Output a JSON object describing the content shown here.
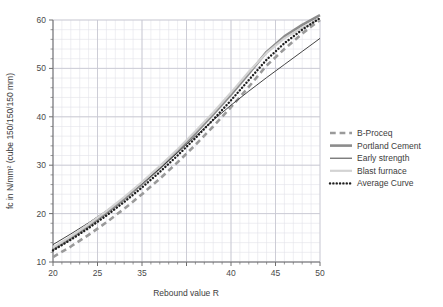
{
  "chart_data": {
    "type": "line",
    "title": "",
    "xlabel": "Rebound value R",
    "ylabel": "fc in N/mm² (cube 150/150/150 mm)",
    "xlim": [
      20,
      50
    ],
    "ylim": [
      10,
      60
    ],
    "xticks": [
      20,
      25,
      30,
      35,
      40,
      45,
      50
    ],
    "xtick_labels": [
      "20",
      "25",
      "35",
      "40",
      "45",
      "50"
    ],
    "xtick_label_values": [
      20,
      25,
      30,
      40,
      45,
      50
    ],
    "yticks": [
      10,
      20,
      30,
      40,
      50,
      60
    ],
    "ytick_labels": [
      "10",
      "20",
      "30",
      "40",
      "50",
      "60"
    ],
    "grid": true,
    "grid_minor": true,
    "minor_x_step": 1,
    "minor_y_step": 2,
    "legend_position": "right",
    "x": [
      20,
      22,
      24,
      26,
      28,
      30,
      32,
      34,
      36,
      38,
      40,
      42,
      44,
      46,
      48,
      50
    ],
    "series": [
      {
        "name": "B-Proceq",
        "style": "dashed",
        "color": "#9a9a9a",
        "width": 2.6,
        "values": [
          11.0,
          13.2,
          15.6,
          18.2,
          21.0,
          24.0,
          27.2,
          30.6,
          34.2,
          38.0,
          42.0,
          46.2,
          50.6,
          54.0,
          57.2,
          60.0
        ]
      },
      {
        "name": "Portland Cement",
        "style": "solid",
        "color": "#8c8c8c",
        "width": 2.6,
        "values": [
          12.6,
          14.9,
          17.4,
          20.1,
          23.0,
          26.1,
          29.4,
          32.9,
          36.6,
          40.5,
          44.6,
          48.9,
          53.4,
          56.6,
          59.0,
          61.0
        ]
      },
      {
        "name": "Early strength",
        "style": "solid",
        "color": "#2f2f2f",
        "width": 0.9,
        "values": [
          13.6,
          15.8,
          18.1,
          20.6,
          23.3,
          26.2,
          29.3,
          32.6,
          36.0,
          39.3,
          42.4,
          45.3,
          48.1,
          50.8,
          53.5,
          56.2
        ]
      },
      {
        "name": "Blast furnace",
        "style": "solid",
        "color": "#d3d3d3",
        "width": 2.2,
        "values": [
          13.0,
          15.3,
          17.8,
          20.5,
          23.4,
          26.5,
          29.8,
          33.3,
          37.0,
          40.9,
          45.0,
          49.3,
          53.2,
          56.2,
          58.4,
          60.2
        ]
      },
      {
        "name": "Average Curve",
        "style": "dotted",
        "color": "#1f1f1f",
        "width": 2.4,
        "values": [
          12.4,
          14.6,
          17.0,
          19.6,
          22.4,
          25.4,
          28.6,
          32.0,
          35.6,
          39.4,
          43.4,
          47.6,
          51.8,
          55.2,
          58.0,
          60.4
        ]
      }
    ]
  },
  "legend": {
    "entries": [
      {
        "label": "B-Proceq"
      },
      {
        "label": "Portland Cement"
      },
      {
        "label": "Early strength"
      },
      {
        "label": "Blast furnace"
      },
      {
        "label": "Average Curve"
      }
    ]
  },
  "axes": {
    "x_title": "Rebound value R",
    "y_title": "fc in N/mm² (cube 150/150/150 mm)"
  }
}
